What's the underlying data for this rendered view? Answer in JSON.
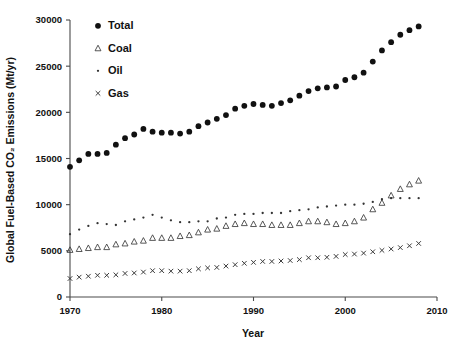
{
  "chart_data": {
    "type": "scatter",
    "title": "",
    "xlabel": "Year",
    "ylabel": "Global Fuel-Based CO2 Emissions (Mt/yr)",
    "ylabel_display": "Global Fuel-Based CO₂ Emissions (Mt/yr)",
    "xlim": [
      1970,
      2010
    ],
    "ylim": [
      0,
      30000
    ],
    "xticks": [
      1970,
      1980,
      1990,
      2000,
      2010
    ],
    "xticklabels": [
      "1970",
      "1980",
      "1990",
      "2000",
      "2010"
    ],
    "yticks": [
      0,
      5000,
      10000,
      15000,
      20000,
      25000,
      30000
    ],
    "yticklabels": [
      "0",
      "5000",
      "10000",
      "15000",
      "20000",
      "25000",
      "30000"
    ],
    "grid": false,
    "legend_position": "upper-left-inside",
    "x": [
      1970,
      1971,
      1972,
      1973,
      1974,
      1975,
      1976,
      1977,
      1978,
      1979,
      1980,
      1981,
      1982,
      1983,
      1984,
      1985,
      1986,
      1987,
      1988,
      1989,
      1990,
      1991,
      1992,
      1993,
      1994,
      1995,
      1996,
      1997,
      1998,
      1999,
      2000,
      2001,
      2002,
      2003,
      2004,
      2005,
      2006,
      2007,
      2008
    ],
    "series": [
      {
        "name": "Total",
        "marker": "filled-circle",
        "color": "#111111",
        "values": [
          14100,
          14800,
          15500,
          15500,
          15600,
          16500,
          17200,
          17600,
          18200,
          17900,
          17800,
          17800,
          17700,
          17900,
          18500,
          18900,
          19300,
          19700,
          20400,
          20700,
          20900,
          20800,
          20700,
          21000,
          21300,
          21800,
          22300,
          22600,
          22700,
          22800,
          23500,
          23800,
          24300,
          25500,
          26700,
          27600,
          28400,
          28900,
          29300
        ]
      },
      {
        "name": "Coal",
        "marker": "open-triangle",
        "color": "#3a3a3a",
        "values": [
          5100,
          5200,
          5300,
          5400,
          5400,
          5700,
          5800,
          6000,
          6100,
          6400,
          6400,
          6400,
          6600,
          6700,
          7000,
          7300,
          7400,
          7700,
          7900,
          8000,
          7900,
          7900,
          7800,
          7800,
          7800,
          8000,
          8200,
          8200,
          8100,
          7900,
          8000,
          8200,
          8600,
          9500,
          10200,
          11000,
          11700,
          12200,
          12600
        ]
      },
      {
        "name": "Oil",
        "marker": "small-dot",
        "color": "#333333",
        "values": [
          6800,
          7300,
          7700,
          8000,
          7900,
          7800,
          8200,
          8400,
          8600,
          8900,
          8600,
          8300,
          8100,
          8100,
          8200,
          8200,
          8500,
          8600,
          8900,
          9000,
          9000,
          9100,
          9100,
          9100,
          9300,
          9400,
          9500,
          9700,
          9800,
          9900,
          10000,
          10000,
          10100,
          10300,
          10600,
          10700,
          10700,
          10700,
          10700
        ]
      },
      {
        "name": "Gas",
        "marker": "cross",
        "color": "#333333",
        "values": [
          2000,
          2150,
          2250,
          2350,
          2350,
          2400,
          2550,
          2600,
          2700,
          2850,
          2850,
          2800,
          2800,
          2850,
          3050,
          3150,
          3200,
          3350,
          3500,
          3650,
          3750,
          3850,
          3850,
          3900,
          3950,
          4050,
          4250,
          4250,
          4300,
          4400,
          4600,
          4650,
          4750,
          4900,
          5050,
          5200,
          5350,
          5550,
          5800
        ]
      }
    ]
  },
  "legend": {
    "items": [
      {
        "label": "Total",
        "marker": "filled-circle"
      },
      {
        "label": "Coal",
        "marker": "open-triangle"
      },
      {
        "label": "Oil",
        "marker": "small-dot"
      },
      {
        "label": "Gas",
        "marker": "cross"
      }
    ]
  }
}
